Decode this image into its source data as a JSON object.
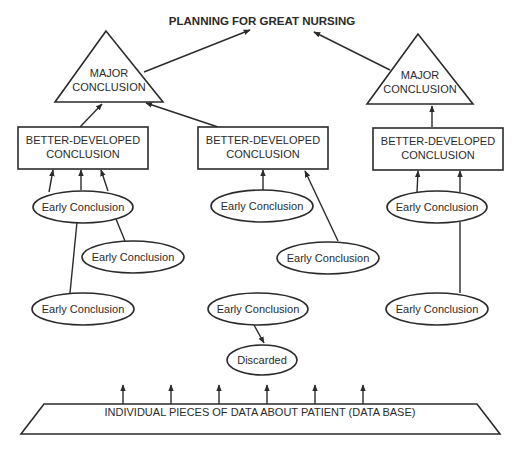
{
  "title": "PLANNING FOR GREAT NURSING",
  "major_conclusions": [
    {
      "line1": "MAJOR",
      "line2": "CONCLUSION"
    },
    {
      "line1": "MAJOR",
      "line2": "CONCLUSION"
    }
  ],
  "better_developed": [
    {
      "line1": "BETTER-DEVELOPED",
      "line2": "CONCLUSION"
    },
    {
      "line1": "BETTER-DEVELOPED",
      "line2": "CONCLUSION"
    },
    {
      "line1": "BETTER-DEVELOPED",
      "line2": "CONCLUSION"
    }
  ],
  "early_conclusions": [
    "Early Conclusion",
    "Early Conclusion",
    "Early Conclusion",
    "Early Conclusion",
    "Early Conclusion",
    "Early Conclusion",
    "Early Conclusion",
    "Early Conclusion"
  ],
  "discarded": "Discarded",
  "database": "INDIVIDUAL PIECES OF DATA ABOUT PATIENT (DATA BASE)",
  "colors": {
    "stroke": "#2b2b2b",
    "background": "#ffffff"
  }
}
